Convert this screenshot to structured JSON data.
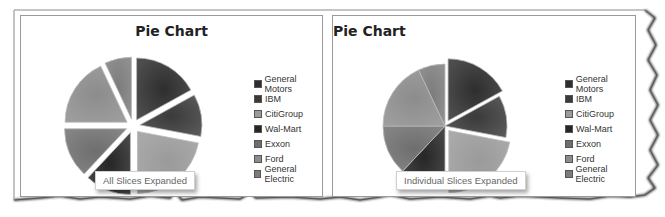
{
  "chart_data": [
    {
      "type": "pie",
      "title": "Pie Chart",
      "annotation": "All Slices Expanded",
      "explode": "all",
      "categories": [
        "General Motors",
        "IBM",
        "CitiGroup",
        "Wal-Mart",
        "Exxon",
        "Ford",
        "General Electric"
      ],
      "values": [
        17,
        11,
        22,
        12,
        13,
        18,
        7
      ],
      "legend_position": "right"
    },
    {
      "type": "pie",
      "title": "Pie Chart",
      "annotation": "Individual Slices Expanded",
      "explode": [
        "General Motors",
        "CitiGroup"
      ],
      "categories": [
        "General Motors",
        "IBM",
        "CitiGroup",
        "Wal-Mart",
        "Exxon",
        "Ford",
        "General Electric"
      ],
      "values": [
        17,
        11,
        22,
        12,
        13,
        18,
        7
      ],
      "legend_position": "right"
    }
  ],
  "charts": {
    "left": {
      "title": "Pie Chart",
      "caption": "All Slices Expanded"
    },
    "right": {
      "title": "Pie Chart",
      "caption": "Individual Slices Expanded"
    }
  },
  "legend": {
    "items": [
      {
        "label": "General Motors",
        "color": "#2e2e2e"
      },
      {
        "label": "IBM",
        "color": "#3a3a3a"
      },
      {
        "label": "CitiGroup",
        "color": "#9a9a9a"
      },
      {
        "label": "Wal-Mart",
        "color": "#262626"
      },
      {
        "label": "Exxon",
        "color": "#6e6e6e"
      },
      {
        "label": "Ford",
        "color": "#8c8c8c"
      },
      {
        "label": "General Electric",
        "color": "#7c7c7c"
      }
    ]
  }
}
